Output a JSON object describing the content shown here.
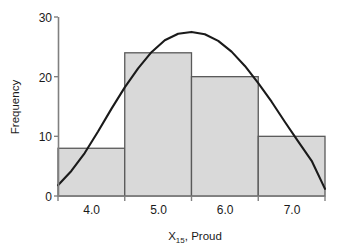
{
  "chart_data": {
    "type": "bar",
    "title": "",
    "subtitle": "",
    "xlabel": "X15, Proud",
    "xlabel_main": "X",
    "xlabel_sub": "15",
    "xlabel_rest": ", Proud",
    "ylabel": "Frequency",
    "categories": [
      "3.5-4.5",
      "4.5-5.5",
      "5.5-6.5",
      "6.5-7.5"
    ],
    "bin_edges": [
      3.5,
      4.5,
      5.5,
      6.5,
      7.5
    ],
    "values": [
      8,
      24,
      20,
      10
    ],
    "xlim": [
      3.5,
      7.5
    ],
    "ylim": [
      0,
      30
    ],
    "xticks": [
      3.5,
      4.5,
      5.5,
      6.5,
      7.5
    ],
    "xtick_labels": [
      "",
      "4.0",
      "5.0",
      "6.0",
      "7.0"
    ],
    "xtick_label_positions": [
      4.0,
      5.0,
      6.0,
      7.0
    ],
    "yticks": [
      0,
      10,
      20,
      30
    ],
    "ytick_labels": [
      "0",
      "10",
      "20",
      "30"
    ],
    "grid": false,
    "legend": "none",
    "bar_fill_color": "#d9d9d9",
    "bar_edge_color": "#595959",
    "axis_color": "#808080",
    "curve_color": "#1a1a1a",
    "overlay": {
      "type": "line",
      "name": "normal-curve",
      "x": [
        3.5,
        3.7,
        3.9,
        4.1,
        4.3,
        4.5,
        4.7,
        4.9,
        5.1,
        5.3,
        5.5,
        5.7,
        5.9,
        6.1,
        6.3,
        6.5,
        6.7,
        6.9,
        7.1,
        7.3,
        7.5
      ],
      "y": [
        1.8,
        4.2,
        7.2,
        10.8,
        14.6,
        18.2,
        21.4,
        24.1,
        26.1,
        27.2,
        27.5,
        27.1,
        26.0,
        24.2,
        21.8,
        18.9,
        15.8,
        12.4,
        9.1,
        5.9,
        1.2
      ]
    }
  },
  "axes": {
    "y_axis_title": "Frequency",
    "x_axis_title_main": "X",
    "x_axis_title_sub": "15",
    "x_axis_title_rest": ", Proud"
  },
  "ticks": {
    "y": [
      "30",
      "20",
      "10",
      "0"
    ],
    "x": [
      "4.0",
      "5.0",
      "6.0",
      "7.0"
    ]
  }
}
